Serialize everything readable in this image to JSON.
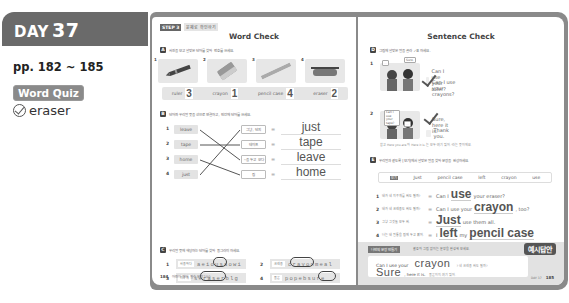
{
  "sidebar": {
    "day_label": "DAY",
    "day_number": "37",
    "pages": "pp. 182 ~ 185",
    "quiz_badge": "Word Quiz",
    "quiz_items": [
      {
        "word": "eraser",
        "checked": true
      }
    ]
  },
  "left_page": {
    "step_label": "STEP 3",
    "step_text": "문제로 확인하기",
    "title": "Word Check",
    "section_a": {
      "letter": "A",
      "instruction": "사진을 보고 알맞은 단어를 찾아 번호를 쓰세요.",
      "pictures": [
        {
          "n": "1",
          "item": "crayon-image"
        },
        {
          "n": "2",
          "item": "eraser-image"
        },
        {
          "n": "3",
          "item": "ruler-image"
        },
        {
          "n": "4",
          "item": "pencil-case-image"
        }
      ],
      "answers": [
        {
          "word": "ruler",
          "value": "3"
        },
        {
          "word": "crayon",
          "value": "1"
        },
        {
          "word": "pencil case",
          "value": "4"
        },
        {
          "word": "eraser",
          "value": "2"
        }
      ]
    },
    "section_b": {
      "letter": "B",
      "instruction": "단어와 우리말 뜻을 선으로 연결하고, 빈칸에 단어를 쓰세요.",
      "left_words": [
        "leave",
        "tape",
        "home",
        "just"
      ],
      "right_meanings": [
        "그냥, 단지",
        "테이프",
        "~을 두고 오다",
        "집"
      ],
      "answers": [
        "just",
        "tape",
        "leave",
        "home"
      ],
      "connections": [
        [
          1,
          3
        ],
        [
          2,
          2
        ],
        [
          3,
          4
        ],
        [
          4,
          1
        ]
      ]
    },
    "section_c": {
      "letter": "C",
      "instruction": "우리말 뜻에 해당하는 단어를 찾아 동그라미 하세요.",
      "items": [
        {
          "n": "1",
          "meaning": "사용하다",
          "letters": "aeiousaowi",
          "answer": "use"
        },
        {
          "n": "2",
          "meaning": "크레용",
          "letters": "crayonmeal",
          "answer": "crayon"
        },
        {
          "n": "3",
          "meaning": "지우개",
          "letters": "seraserblg",
          "answer": "eraser"
        },
        {
          "n": "4",
          "meaning": "물론",
          "letters": "popebsure",
          "answer": "sure"
        }
      ]
    },
    "footer_page": "184",
    "footer_text": "어린이 영어 필수 문장 150"
  },
  "right_page": {
    "title": "Sentence Check",
    "section_d": {
      "letter": "D",
      "instruction": "그림에 알맞은 말을 골라 ✓표 하세요.",
      "items": [
        {
          "n": "1",
          "bubble_a": "...",
          "bubble_b": "Sure.",
          "options": [
            "Can I use your ruler?",
            "Can I use your crayons?"
          ],
          "checked": 1
        },
        {
          "n": "2",
          "bubble_a": "Can I use your tape?",
          "bubble_b": "...",
          "options": [
            "Sure, here it is.",
            "Thank you."
          ],
          "checked": 0
        }
      ],
      "note": "참고 Here you are.와 Here it is.는 모두 '여기 있어.'라는 뜻이에요."
    },
    "section_e": {
      "letter": "E",
      "instruction": "우리말과 같도록 [보기]에서 알맞은 말을 찾아 문장을 완성하세요.",
      "wordbank_tag": "보기",
      "wordbank": [
        "Just",
        "pencil case",
        "left",
        "crayon",
        "use"
      ],
      "rows": [
        {
          "n": "1",
          "korean": "내가 네 지우개를 써도 될까?",
          "pre": "Can I",
          "fill": "use",
          "post": "your eraser?"
        },
        {
          "n": "2",
          "korean": "내가 네 크레용도 써도 될까?",
          "pre": "Can I use your",
          "fill": "crayon",
          "post": ", too?"
        },
        {
          "n": "3",
          "korean": "그냥 그것들 모두 써.",
          "pre": "",
          "fill": "Just",
          "post": "use them all."
        },
        {
          "n": "4",
          "korean": "나는 내 필통을 집에 두고 왔어.",
          "pre": "I",
          "fill": "left",
          "mid": "my",
          "fill2": "pencil case",
          "post": ""
        }
      ]
    },
    "bottom_box": {
      "tag": "나만의 문장 만들기",
      "instruction": "괄호와 그림 없이는 문장을 완성해 보세요.",
      "answer_badge": "예시답안",
      "line1_pre": "Can I use your",
      "line1_fill": "crayon",
      "line1_note": "? 네 크레용 써도 될까?",
      "line2_fill": "Sure",
      "line2_post": ", here it is.",
      "line2_note": "물론이지, 여기 있어."
    },
    "footer_text": "DAY 37",
    "footer_page": "185"
  }
}
